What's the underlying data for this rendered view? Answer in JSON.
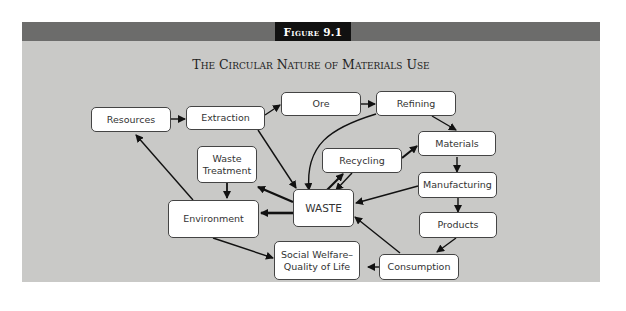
{
  "figure": {
    "label": "Figure 9.1",
    "title": "The Circular Nature of Materials Use"
  },
  "nodes": {
    "resources": "Resources",
    "extraction": "Extraction",
    "ore": "Ore",
    "refining": "Refining",
    "materials": "Materials",
    "recycling": "Recycling",
    "waste_treatment": "Waste Treatment",
    "environment": "Environment",
    "waste": "WASTE",
    "manufacturing": "Manufacturing",
    "products": "Products",
    "social_welfare": "Social Welfare– Quality of Life",
    "consumption": "Consumption"
  },
  "edges": [
    {
      "from": "Resources",
      "to": "Extraction"
    },
    {
      "from": "Extraction",
      "to": "Ore"
    },
    {
      "from": "Ore",
      "to": "Refining"
    },
    {
      "from": "Refining",
      "to": "Materials"
    },
    {
      "from": "Refining",
      "to": "WASTE"
    },
    {
      "from": "Extraction",
      "to": "WASTE"
    },
    {
      "from": "Materials",
      "to": "Manufacturing"
    },
    {
      "from": "Recycling",
      "to": "Materials"
    },
    {
      "from": "WASTE",
      "to": "Recycling"
    },
    {
      "from": "Recycling",
      "to": "WASTE"
    },
    {
      "from": "Manufacturing",
      "to": "WASTE"
    },
    {
      "from": "Manufacturing",
      "to": "Products"
    },
    {
      "from": "Products",
      "to": "Consumption"
    },
    {
      "from": "Consumption",
      "to": "WASTE"
    },
    {
      "from": "Consumption",
      "to": "Social Welfare– Quality of Life"
    },
    {
      "from": "WASTE",
      "to": "Waste Treatment"
    },
    {
      "from": "WASTE",
      "to": "Environment"
    },
    {
      "from": "Waste Treatment",
      "to": "Environment"
    },
    {
      "from": "Environment",
      "to": "Resources"
    },
    {
      "from": "Environment",
      "to": "Social Welfare– Quality of Life"
    }
  ]
}
